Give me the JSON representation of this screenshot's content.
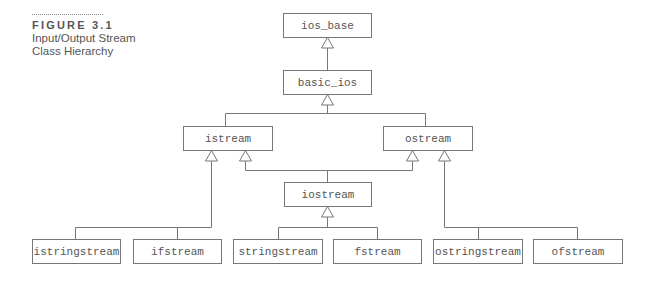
{
  "caption": {
    "figure_number": "FIGURE 3.1",
    "title_line1": "Input/Output Stream",
    "title_line2": "Class Hierarchy"
  },
  "nodes": {
    "ios_base": "ios_base",
    "basic_ios": "basic_ios",
    "istream": "istream",
    "ostream": "ostream",
    "iostream": "iostream",
    "istringstream": "istringstream",
    "ifstream": "ifstream",
    "stringstream": "stringstream",
    "fstream": "fstream",
    "ostringstream": "ostringstream",
    "ofstream": "ofstream"
  },
  "edges": [
    {
      "from": "basic_ios",
      "to": "ios_base"
    },
    {
      "from": "istream",
      "to": "basic_ios"
    },
    {
      "from": "ostream",
      "to": "basic_ios"
    },
    {
      "from": "iostream",
      "to": "istream"
    },
    {
      "from": "iostream",
      "to": "ostream"
    },
    {
      "from": "istringstream",
      "to": "istream"
    },
    {
      "from": "ifstream",
      "to": "istream"
    },
    {
      "from": "stringstream",
      "to": "iostream"
    },
    {
      "from": "fstream",
      "to": "iostream"
    },
    {
      "from": "ostringstream",
      "to": "ostream"
    },
    {
      "from": "ofstream",
      "to": "ostream"
    }
  ]
}
